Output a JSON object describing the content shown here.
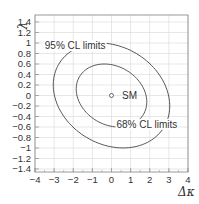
{
  "chart_data": {
    "type": "contour",
    "title": "",
    "xlabel": "Δκ",
    "ylabel": "λ",
    "xlim": [
      -4,
      4
    ],
    "ylim": [
      -1.5,
      1.5
    ],
    "grid": true,
    "x_ticks": [
      -4,
      -3,
      -2,
      -1,
      0,
      1,
      2,
      3,
      4
    ],
    "x_tick_labels": [
      "−4",
      "−3",
      "−2",
      "−1",
      "0",
      "1",
      "2",
      "3",
      "4"
    ],
    "y_ticks": [
      1.4,
      1.2,
      1,
      0.8,
      0.6,
      0.4,
      0.2,
      0,
      -0.2,
      -0.4,
      -0.6,
      -0.8,
      -1,
      -1.2,
      -1.4
    ],
    "y_tick_labels": [
      "1.4",
      "1.2",
      "1",
      "0.8",
      "0.6",
      "0.4",
      "0.2",
      "0",
      "−0.2",
      "−0.4",
      "−0.6",
      "−0.8",
      "−1",
      "−1.2",
      "−1.4"
    ],
    "series": [
      {
        "name": "95% CL limits",
        "shape": "ellipse",
        "center": [
          0,
          0
        ],
        "semi_axes": [
          3.3,
          0.55
        ],
        "rotation_deg": -23
      },
      {
        "name": "68% CL limits",
        "shape": "ellipse",
        "center": [
          0,
          0
        ],
        "semi_axes": [
          2.0,
          0.33
        ],
        "rotation_deg": -23
      }
    ],
    "points": [
      {
        "label": "SM",
        "x": 0,
        "y": 0,
        "marker": "open-circle"
      }
    ],
    "annotations": [
      {
        "text": "95% CL limits",
        "x": -1.9,
        "y": 0.95
      },
      {
        "text": "68% CL limits",
        "x": 1.85,
        "y": -0.55
      },
      {
        "text": "SM",
        "x": 0.55,
        "y": 0
      }
    ]
  }
}
